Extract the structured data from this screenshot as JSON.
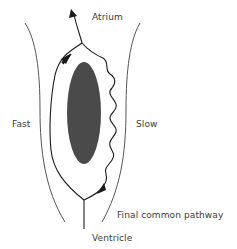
{
  "diagram": {
    "type": "av-nodal-reentry-schematic",
    "labels": {
      "atrium": "Atrium",
      "fast": "Fast",
      "slow": "Slow",
      "final_common_pathway": "Final common pathway",
      "ventricle": "Ventricle"
    },
    "colors": {
      "line": "#1a1a1a",
      "wall": "#555555",
      "ellipse": "#4a4a4a",
      "text": "#3a3a3a"
    },
    "nodes": [
      "Atrium",
      "Fast pathway",
      "Slow pathway",
      "Final common pathway",
      "Ventricle"
    ],
    "edges": [
      {
        "from": "Final common pathway",
        "to": "Fast pathway",
        "direction": "up"
      },
      {
        "from": "Fast pathway",
        "to": "Atrium",
        "direction": "up"
      },
      {
        "from": "Atrium",
        "to": "Slow pathway",
        "direction": "down"
      },
      {
        "from": "Slow pathway",
        "to": "Final common pathway",
        "direction": "down"
      },
      {
        "from": "Final common pathway",
        "to": "Ventricle",
        "direction": "down"
      }
    ]
  }
}
